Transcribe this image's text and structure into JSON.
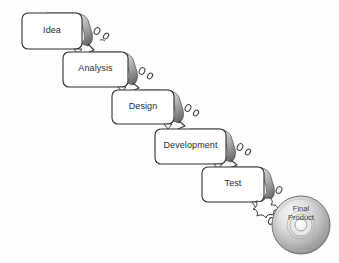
{
  "diagram": {
    "type": "waterfall-sdlc",
    "background_color": "#fdfdfd",
    "box_fill": "#ffffff",
    "box_border_color": "#2f2f2f",
    "lip_gradient_from": "#f2f2f2",
    "lip_gradient_to": "#6e6e6e",
    "text_color": "#2b2b2b",
    "stages": [
      {
        "label": "Idea",
        "x": 22,
        "y": 13,
        "w": 60,
        "h": 36
      },
      {
        "label": "Analysis",
        "x": 63,
        "y": 52,
        "w": 65,
        "h": 35
      },
      {
        "label": "Design",
        "x": 112,
        "y": 90,
        "w": 62,
        "h": 34
      },
      {
        "label": "Development",
        "x": 155,
        "y": 129,
        "w": 71,
        "h": 35
      },
      {
        "label": "Test",
        "x": 202,
        "y": 167,
        "w": 62,
        "h": 35
      }
    ],
    "final_product": {
      "label_line1": "Final",
      "label_line2": "Product",
      "cx": 301,
      "cy": 225,
      "r": 29,
      "hole_r": 8,
      "fill_light": "#f4f4f4",
      "fill_dark": "#8d8d8d"
    }
  }
}
